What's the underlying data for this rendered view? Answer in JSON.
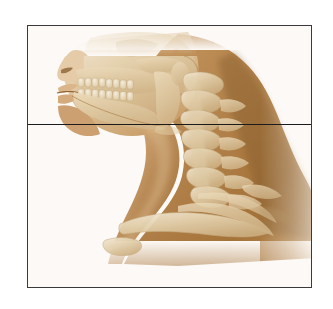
{
  "figure": {
    "kind": "anatomical-illustration",
    "view": "lateral (sagittal profile) view of human head and neck",
    "subject": "skull, mandible, cervical spine and upper thorax skeleton within soft-tissue silhouette",
    "orientation": "facing left",
    "background_color": "#ffffff",
    "frame": {
      "border_color": "#3a3a3c",
      "border_width_px": 1.6,
      "left": 27,
      "top": 25,
      "width": 285,
      "height": 263
    },
    "reference_line": {
      "name": "horizontal reference line",
      "color": "#1b1b1d",
      "thickness_px": 1.5,
      "orientation": "horizontal",
      "spans": "full width of frame",
      "y_in_frame": 98,
      "crosses": "chin / mandibular body anteriorly and C4 vertebral level posteriorly"
    },
    "palette": {
      "soft_tissue_mid": "#b5864f",
      "soft_tissue_dark": "#97672f",
      "soft_tissue_light": "#cfa472",
      "soft_tissue_pale": "#e2c7a2",
      "bone_light": "#efe3c6",
      "bone_mid": "#ddc69c",
      "bone_shadow": "#c2a776",
      "highlight": "#f6efe0",
      "outline": "#8a5f2c",
      "white": "#ffffff"
    },
    "structures": [
      {
        "id": "nose",
        "label": "nasal profile"
      },
      {
        "id": "lips",
        "label": "lips and oral opening"
      },
      {
        "id": "maxilla",
        "label": "maxilla with upper dental arch"
      },
      {
        "id": "upper-teeth",
        "label": "upper teeth row"
      },
      {
        "id": "lower-teeth",
        "label": "lower teeth row"
      },
      {
        "id": "mandible",
        "label": "mandible (lower jaw) with ramus and angle"
      },
      {
        "id": "zygomatic",
        "label": "zygomatic arch"
      },
      {
        "id": "cranium",
        "label": "cranial base (cut off at top border)"
      },
      {
        "id": "mastoid",
        "label": "mastoid process and ear region"
      },
      {
        "id": "c1",
        "label": "atlas (C1)"
      },
      {
        "id": "c2",
        "label": "axis (C2)"
      },
      {
        "id": "c3",
        "label": "cervical vertebra C3"
      },
      {
        "id": "c4",
        "label": "cervical vertebra C4"
      },
      {
        "id": "c5",
        "label": "cervical vertebra C5"
      },
      {
        "id": "c6",
        "label": "cervical vertebra C6"
      },
      {
        "id": "c7",
        "label": "cervical vertebra C7 (vertebra prominens)"
      },
      {
        "id": "hyoid",
        "label": "hyoid bone / laryngeal region"
      },
      {
        "id": "clavicle",
        "label": "clavicle"
      },
      {
        "id": "manubrium",
        "label": "manubrium of sternum"
      },
      {
        "id": "first-rib",
        "label": "first rib"
      },
      {
        "id": "scapula-spine",
        "label": "scapular spine / acromion"
      },
      {
        "id": "trapezius",
        "label": "trapezius soft-tissue contour of neck and shoulder"
      }
    ]
  }
}
